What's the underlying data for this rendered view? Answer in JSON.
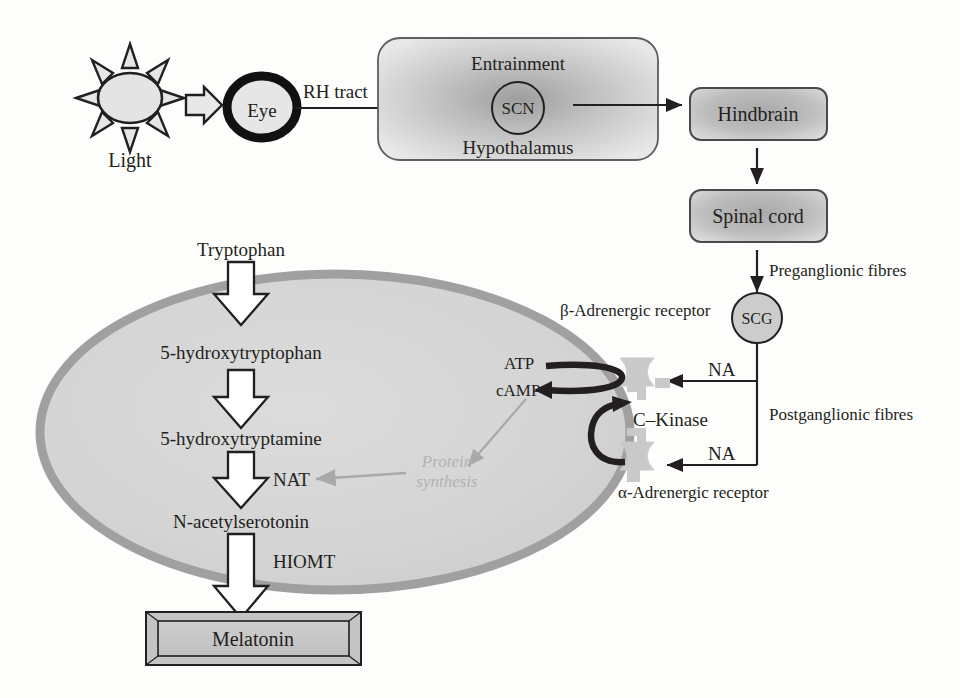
{
  "diagram": {
    "colors": {
      "ink": "#231f20",
      "box_fill_light": "#e4e4e4",
      "box_fill_mid": "#b8b8b8",
      "ellipse_fill": "#d6d6d6",
      "ellipse_border": "#9b9b9b",
      "receptor_fill": "#c9c9c9",
      "faded_text": "#b2b2b2",
      "faded_arrow": "#a9a9a9"
    }
  },
  "light_source": {
    "label": "Light",
    "icon": "sun-icon",
    "rays": 8
  },
  "eye": {
    "label": "Eye"
  },
  "tract": {
    "label": "RH tract"
  },
  "hypothalamus": {
    "top_label": "Entrainment",
    "nucleus_label": "SCN",
    "bottom_label": "Hypothalamus"
  },
  "brainstem": {
    "hindbrain_label": "Hindbrain",
    "spinal_cord_label": "Spinal cord"
  },
  "fibres": {
    "preganglionic_label": "Preganglionic fibres",
    "postganglionic_label": "Postganglionic fibres"
  },
  "ganglion": {
    "label": "SCG"
  },
  "neurotransmitter": {
    "beta_label": "NA",
    "alpha_label": "NA"
  },
  "receptors": {
    "beta_label": "β-Adrenergic receptor",
    "alpha_label": "α-Adrenergic receptor"
  },
  "second_messenger": {
    "substrate_label": "ATP",
    "product_label": "cAMP",
    "kinase_label": "C–Kinase",
    "protein_synthesis_line1": "Protein",
    "protein_synthesis_line2": "synthesis"
  },
  "biosynthesis": {
    "steps": [
      {
        "name": "Tryptophan"
      },
      {
        "name": "5-hydroxytryptophan"
      },
      {
        "name": "5-hydroxytryptamine"
      },
      {
        "name": "N-acetylserotonin"
      }
    ],
    "enzymes": [
      {
        "name": "NAT"
      },
      {
        "name": "HIOMT"
      }
    ],
    "product": {
      "name": "Melatonin"
    }
  }
}
